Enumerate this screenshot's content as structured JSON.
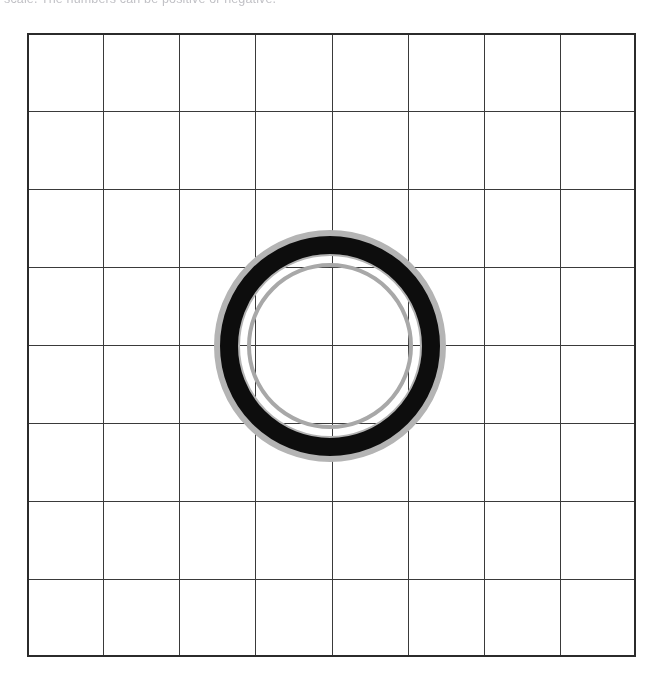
{
  "page": {
    "width": 663,
    "height": 686,
    "background_color": "#ffffff"
  },
  "caption": {
    "text": "scale. The numbers can be positive or negative.",
    "color": "#9a9aa2",
    "state": "clipped at top edge, only descender pixels visible"
  },
  "figure": {
    "name": "grid-with-concentric-ring-diagram",
    "grid": {
      "columns": 8,
      "rows": 8,
      "left": 27,
      "top": 33,
      "width": 609,
      "height": 624,
      "cell_width": 76.125,
      "cell_height": 78,
      "line_color": "#3a3a3a",
      "line_width": 1.6,
      "border_color": "#2b2b2b",
      "border_width": 2.0,
      "fill_color": "#ffffff"
    },
    "ring": {
      "center_x": 330,
      "center_y": 346,
      "halo_outer_radius": 114,
      "halo_color": "#b4b4b4",
      "black_outer_radius": 110,
      "black_inner_radius": 92,
      "black_color": "#0d0d0d",
      "inner_ring_radius": 81,
      "inner_ring_color": "#a8a8a8",
      "inner_ring_width": 4,
      "core_color": "#ffffff"
    }
  },
  "chart_data": {
    "type": "diagram",
    "title": "",
    "grid_columns": 8,
    "grid_rows": 8,
    "shapes": [
      {
        "shape": "circle",
        "role": "outer-grey-halo",
        "cx": 330,
        "cy": 346,
        "r": 112,
        "stroke": "#b4b4b4",
        "stroke_width": 5,
        "fill": "none"
      },
      {
        "shape": "circle",
        "role": "thick-black-annulus",
        "cx": 330,
        "cy": 346,
        "r": 101,
        "stroke": "#0d0d0d",
        "stroke_width": 18,
        "fill": "none"
      },
      {
        "shape": "circle",
        "role": "inner-grey-circle",
        "cx": 330,
        "cy": 346,
        "r": 81,
        "stroke": "#a8a8a8",
        "stroke_width": 4,
        "fill": "none"
      }
    ],
    "xlabel": "",
    "ylabel": "",
    "grid": true,
    "legend": "none"
  }
}
